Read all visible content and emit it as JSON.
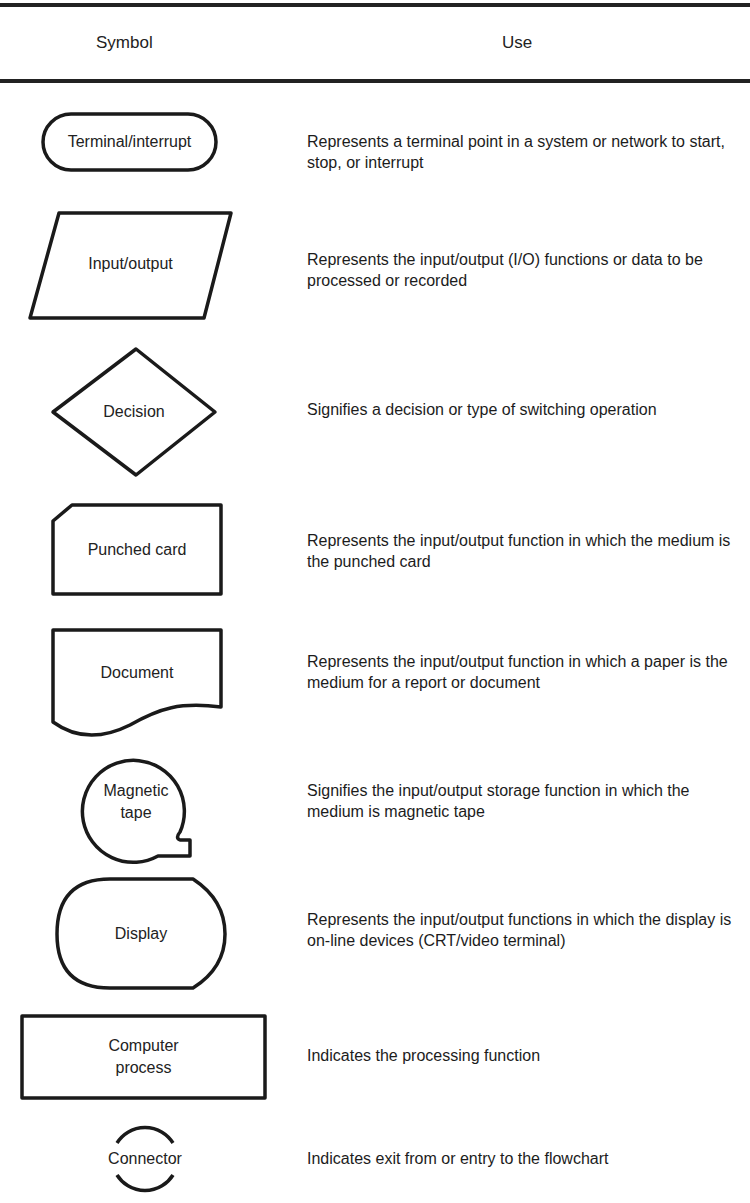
{
  "header": {
    "symbol": "Symbol",
    "use": "Use"
  },
  "rows": [
    {
      "shape": "terminal-shape",
      "label": "Terminal/interrupt",
      "use": "Represents a terminal point in a system or network to start, stop, or interrupt"
    },
    {
      "shape": "input-output-shape",
      "label": "Input/output",
      "use": "Represents the input/output (I/O) functions or data to be processed or recorded"
    },
    {
      "shape": "decision-shape",
      "label": "Decision",
      "use": "Signifies a decision or type of switching operation"
    },
    {
      "shape": "punched-card-shape",
      "label": "Punched card",
      "use": "Represents the input/output function in which the medium is the punched card"
    },
    {
      "shape": "document-shape",
      "label": "Document",
      "use": "Represents the input/output function in which a paper is the medium for a report or document"
    },
    {
      "shape": "magnetic-tape-shape",
      "label_line1": "Magnetic",
      "label_line2": "tape",
      "use": "Signifies the input/output storage function in which the medium is magnetic tape"
    },
    {
      "shape": "display-shape",
      "label": "Display",
      "use": "Represents the input/output functions in which the display is on-line devices (CRT/video terminal)"
    },
    {
      "shape": "process-shape",
      "label_line1": "Computer",
      "label_line2": "process",
      "use": "Indicates the processing function"
    },
    {
      "shape": "connector-shape",
      "label": "Connector",
      "use": "Indicates exit from or entry to the flowchart"
    }
  ]
}
